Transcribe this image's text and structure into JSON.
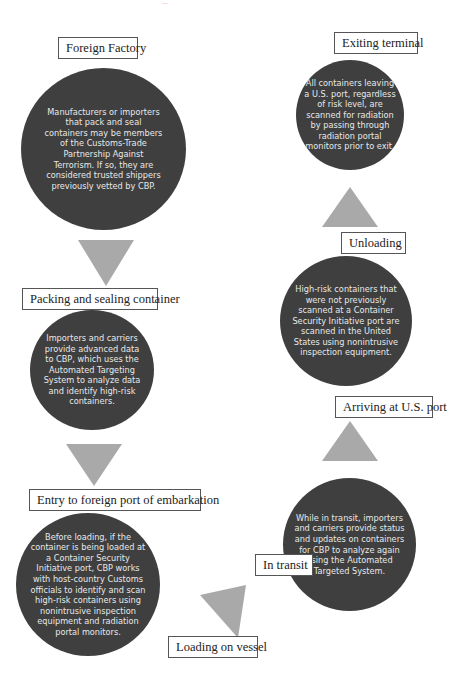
{
  "page_fragment": "...",
  "steps": [
    {
      "label": "Foreign Factory",
      "description": "Manufacturers or importers that pack and seal containers may be members of the Customs-Trade Partnership Against Terrorism. If so, they are considered  trusted shippers previously vetted by CBP."
    },
    {
      "label": "Packing and sealing container",
      "description": "Importers and carriers provide advanced data to CBP, which uses the Automated Targeting System to analyze data and identify high-risk containers."
    },
    {
      "label": "Entry to foreign port of embarkation",
      "description": "Before loading, if the container is being loaded at a Container Security Initiative port, CBP works with host-country Customs officials to identify and scan high-risk containers using nonintrusive inspection equipment and radiation portal monitors."
    },
    {
      "label": "Loading on vessel",
      "description": ""
    },
    {
      "label": "In transit",
      "description": "While in transit, importers and carriers provide status and updates on containers for CBP to analyze again using the Automated Targeted System."
    },
    {
      "label": "Arriving at U.S. port",
      "description": ""
    },
    {
      "label": "Unloading",
      "description": "High-risk containers that were not previously scanned at a Container Security Initiative port are scanned in the United States using nonintrusive inspection equipment."
    },
    {
      "label": "Exiting terminal",
      "description": "All containers leaving a U.S. port, regardless of risk level, are scanned for radiation by passing through radiation portal monitors prior to exit."
    }
  ],
  "colors": {
    "circle_fill": "#3f3f3f",
    "arrow_fill": "#a9a9a9",
    "label_border": "#555555",
    "circle_text": "#e8e8e8"
  }
}
